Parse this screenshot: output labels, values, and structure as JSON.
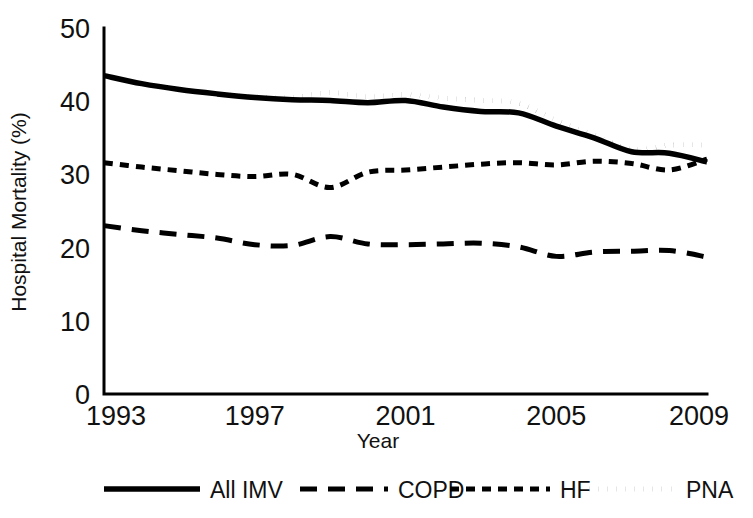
{
  "chart_data": {
    "type": "line",
    "title": "",
    "xlabel": "Year",
    "ylabel": "Hospital Mortality (%)",
    "xlim": [
      1993,
      2009
    ],
    "ylim": [
      0,
      50
    ],
    "ytick_values": [
      0,
      10,
      20,
      30,
      40,
      50
    ],
    "ytick_labels": [
      "0",
      "10",
      "20",
      "30",
      "40",
      "50"
    ],
    "xtick_values": [
      1993,
      1997,
      2001,
      2005,
      2009
    ],
    "xtick_labels": [
      "1993",
      "1997",
      "2001",
      "2005",
      "2009"
    ],
    "grid": false,
    "legend_position": "bottom",
    "x": [
      1993,
      1994,
      1995,
      1996,
      1997,
      1998,
      1999,
      2000,
      2001,
      2002,
      2003,
      2004,
      2005,
      2006,
      2007,
      2008,
      2009
    ],
    "series": [
      {
        "name": "All IMV",
        "style": "solid",
        "color": "#000000",
        "values": [
          43.5,
          42.4,
          41.6,
          41.0,
          40.5,
          40.2,
          40.1,
          39.8,
          40.1,
          39.2,
          38.6,
          38.4,
          36.6,
          35.0,
          33.1,
          32.9,
          31.7
        ]
      },
      {
        "name": "COPD",
        "style": "long-dash",
        "color": "#000000",
        "values": [
          23.0,
          22.3,
          21.8,
          21.3,
          20.4,
          20.3,
          21.5,
          20.5,
          20.4,
          20.5,
          20.6,
          20.1,
          18.8,
          19.4,
          19.5,
          19.6,
          18.7
        ]
      },
      {
        "name": "HF",
        "style": "short-dash",
        "color": "#000000",
        "values": [
          31.6,
          31.0,
          30.5,
          30.0,
          29.7,
          30.0,
          28.2,
          30.3,
          30.6,
          31.0,
          31.4,
          31.6,
          31.3,
          31.8,
          31.5,
          30.6,
          32.1
        ]
      },
      {
        "name": "PNA",
        "style": "dotted",
        "color": "#000000",
        "values": [
          43.5,
          42.4,
          41.6,
          41.0,
          40.6,
          40.5,
          41.2,
          40.6,
          40.9,
          40.4,
          40.1,
          39.7,
          37.4,
          35.4,
          33.4,
          34.0,
          34.0
        ]
      }
    ]
  },
  "legend": {
    "items": [
      {
        "label": "All IMV",
        "style": "solid"
      },
      {
        "label": "COPD",
        "style": "long-dash"
      },
      {
        "label": "HF",
        "style": "short-dash"
      },
      {
        "label": "PNA",
        "style": "dotted"
      }
    ]
  }
}
